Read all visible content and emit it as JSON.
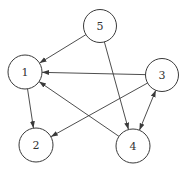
{
  "diagram": {
    "type": "directed-graph",
    "style": {
      "stroke_color": "#3a3a3a",
      "fill_color": "#ffffff",
      "label_color": "#333333",
      "background": "#ffffff"
    },
    "nodes": [
      {
        "id": "1",
        "label": "1",
        "cx": 25,
        "cy": 72,
        "r": 17
      },
      {
        "id": "2",
        "label": "2",
        "cx": 36,
        "cy": 145,
        "r": 17
      },
      {
        "id": "3",
        "label": "3",
        "cx": 162,
        "cy": 75,
        "r": 16.5
      },
      {
        "id": "4",
        "label": "4",
        "cx": 133,
        "cy": 146,
        "r": 17
      },
      {
        "id": "5",
        "label": "5",
        "cx": 100,
        "cy": 26,
        "r": 16.5
      }
    ],
    "edges": [
      {
        "from": "5",
        "to": "1",
        "bidirectional": false
      },
      {
        "from": "5",
        "to": "4",
        "bidirectional": false
      },
      {
        "from": "3",
        "to": "1",
        "bidirectional": false
      },
      {
        "from": "3",
        "to": "2",
        "bidirectional": false
      },
      {
        "from": "4",
        "to": "1",
        "bidirectional": false
      },
      {
        "from": "1",
        "to": "2",
        "bidirectional": false
      },
      {
        "from": "3",
        "to": "4",
        "bidirectional": true
      }
    ]
  }
}
